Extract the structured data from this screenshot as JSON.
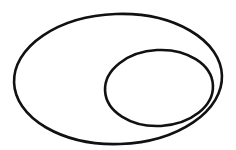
{
  "diagram": {
    "background": "#ffffff",
    "stroke_color": "#111111",
    "shapes": [
      {
        "id": "outer-ellipse",
        "type": "ellipse",
        "cx": 118,
        "cy": 79,
        "rx": 104,
        "ry": 65,
        "stroke_width": 2.6
      },
      {
        "id": "inner-ellipse",
        "type": "ellipse",
        "cx": 159,
        "cy": 88,
        "rx": 54,
        "ry": 38,
        "stroke_width": 2.6
      }
    ]
  }
}
